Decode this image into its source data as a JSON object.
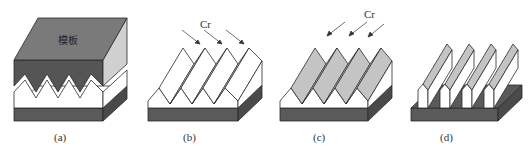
{
  "figure": {
    "panels": [
      {
        "id": "a",
        "label": "(a)",
        "annotation": "模板"
      },
      {
        "id": "b",
        "label": "(b)",
        "annotation": "Cr"
      },
      {
        "id": "c",
        "label": "(c)",
        "annotation": "Cr"
      },
      {
        "id": "d",
        "label": "(d)",
        "annotation": ""
      }
    ]
  },
  "colors": {
    "mold_top": "#7a7a7a",
    "mold_front": "#555555",
    "mold_side": "#d0d0d0",
    "substrate_front": "#5a5a5a",
    "substrate_side": "#4a4a4a",
    "white_face": "#ffffff",
    "gray_face": "#c4c4c4",
    "outline": "#2a2a2a"
  }
}
